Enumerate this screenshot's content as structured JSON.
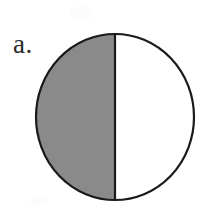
{
  "figure": {
    "label": "a.",
    "background_color": "#ffffff",
    "outline_color": "#1a1a1a",
    "outline_width": 2.2,
    "shaded_fill_color": "#8a8a8a",
    "unshaded_fill_color": "#ffffff",
    "label_color": "#2b2b2b"
  },
  "chart_data": {
    "type": "pie",
    "title": "a.",
    "subtitle": "",
    "xlabel": "",
    "ylabel": "",
    "categories": [
      "shaded",
      "unshaded"
    ],
    "values": [
      50,
      50
    ],
    "value_unit": "percent",
    "colors": [
      "#8a8a8a",
      "#ffffff"
    ],
    "labels_shown": false,
    "legend": "none",
    "grid": false,
    "annotations": [
      "a."
    ],
    "geometry": {
      "shape": "ellipse",
      "center_x": 115,
      "center_y": 117,
      "radius_x": 79,
      "radius_y": 83,
      "divider_orientation": "vertical",
      "divider_x": 115,
      "shaded_side": "left"
    }
  }
}
